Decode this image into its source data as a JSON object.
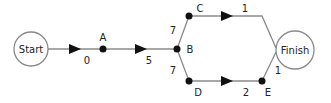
{
  "diagram": {
    "type": "activity-network",
    "colors": {
      "edge": "#8a8a8a",
      "node": "#111111",
      "terminal_stroke": "#8a8a8a",
      "text": "#222222"
    },
    "terminals": {
      "start": {
        "label": "Start"
      },
      "finish": {
        "label": "Finish"
      }
    },
    "nodes": [
      {
        "id": "A",
        "label": "A"
      },
      {
        "id": "B",
        "label": "B"
      },
      {
        "id": "C",
        "label": "C"
      },
      {
        "id": "D",
        "label": "D"
      },
      {
        "id": "E",
        "label": "E"
      }
    ],
    "edges": [
      {
        "from": "Start",
        "to": "A",
        "weight": "0",
        "arrow": true
      },
      {
        "from": "A",
        "to": "B",
        "weight": "5",
        "arrow": true
      },
      {
        "from": "B",
        "to": "C",
        "weight": "7",
        "arrow": false
      },
      {
        "from": "B",
        "to": "D",
        "weight": "7",
        "arrow": false
      },
      {
        "from": "C",
        "to": "Finish",
        "weight": "1",
        "arrow": true
      },
      {
        "from": "D",
        "to": "E",
        "weight": "2",
        "arrow": true
      },
      {
        "from": "E",
        "to": "Finish",
        "weight": "1",
        "arrow": false
      }
    ]
  }
}
